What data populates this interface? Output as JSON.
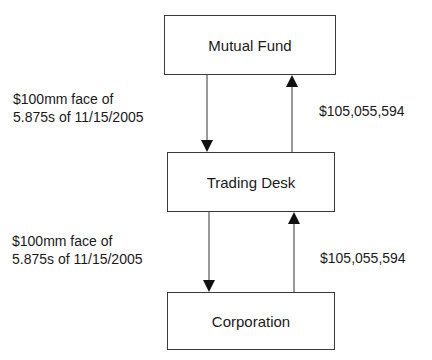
{
  "diagram": {
    "nodes": [
      {
        "id": "mutual_fund",
        "label": "Mutual Fund"
      },
      {
        "id": "trading_desk",
        "label": "Trading Desk"
      },
      {
        "id": "corporation",
        "label": "Corporation"
      }
    ],
    "edges": [
      {
        "from": "mutual_fund",
        "to": "trading_desk",
        "label_line1": "$100mm face of",
        "label_line2": "5.875s of 11/15/2005"
      },
      {
        "from": "trading_desk",
        "to": "mutual_fund",
        "label": "$105,055,594"
      },
      {
        "from": "trading_desk",
        "to": "corporation",
        "label_line1": "$100mm face of",
        "label_line2": "5.875s of 11/15/2005"
      },
      {
        "from": "corporation",
        "to": "trading_desk",
        "label": "$105,055,594"
      }
    ]
  }
}
